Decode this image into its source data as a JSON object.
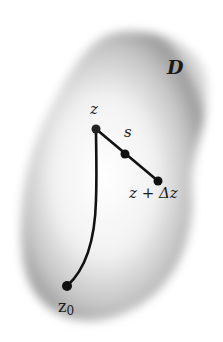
{
  "diagram": {
    "region_label": "D",
    "points": {
      "z": {
        "label": "z",
        "x": 96,
        "y": 129
      },
      "s": {
        "label": "s",
        "x": 125,
        "y": 154
      },
      "z_plus_dz": {
        "label": "z + Δz",
        "x": 158,
        "y": 181
      },
      "z0": {
        "label_base": "z",
        "label_sub": "0",
        "x": 67,
        "y": 286
      }
    },
    "colors": {
      "region_fill_edge": "#8a8a8a",
      "region_fill_center": "#ffffff",
      "curve": "#111111"
    }
  }
}
